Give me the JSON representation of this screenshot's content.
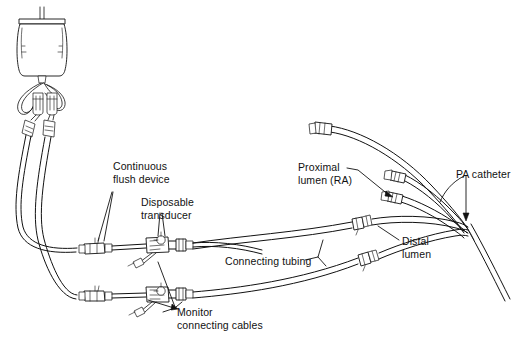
{
  "figure": {
    "background_color": "#ffffff",
    "line_color": "#111111",
    "width": 516,
    "height": 339
  },
  "labels": {
    "continuous_flush_device": "Continuous\nflush device",
    "disposable_transducer": "Disposable\ntransducer",
    "monitor_connecting_cables": "Monitor\nconnecting cables",
    "connecting_tubing": "Connecting tubing",
    "proximal_lumen": "Proximal\nlumen (RA)",
    "distal_lumen": "Distal\nlumen",
    "pa_catheter": "PA catheter"
  },
  "components": {
    "iv_bag": "iv-fluid-bag",
    "drip_chamber_upper": "drip-chamber",
    "drip_chamber_lower": "drip-chamber",
    "flush_device_upper": "continuous-flush-device",
    "flush_device_lower": "continuous-flush-device",
    "transducer_upper": "disposable-transducer",
    "transducer_lower": "disposable-transducer",
    "cable_connector_upper": "monitor-cable-connector",
    "cable_connector_lower": "monitor-cable-connector",
    "inline_connector_proximal": "inline-luer-connector",
    "inline_connector_distal": "inline-luer-connector",
    "lumen_port_balloon": "balloon-inflation-port",
    "lumen_port_proximal": "proximal-lumen-port",
    "lumen_port_distal": "distal-lumen-port",
    "lumen_port_thermistor": "thermistor-port",
    "catheter_shaft": "pa-catheter-shaft"
  }
}
